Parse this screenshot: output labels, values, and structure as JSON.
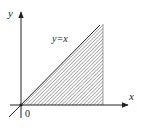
{
  "diagram": {
    "type": "coordinate-region",
    "axes": {
      "x_label": "x",
      "y_label": "y",
      "origin_label": "0"
    },
    "line_label": "y=x",
    "region": "hatched region between line y=x and x-axis, bounded on right by vertical line",
    "colors": {
      "axis": "#222222",
      "hatch": "#555555",
      "background": "#ffffff"
    }
  }
}
